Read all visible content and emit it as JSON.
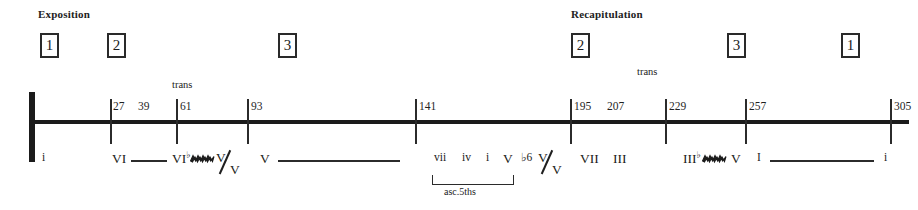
{
  "diagram": {
    "title_sections": [
      {
        "label": "Exposition",
        "x": 38,
        "y": 8
      },
      {
        "label": "Recapitulation",
        "x": 571,
        "y": 8
      }
    ],
    "theme_boxes": [
      {
        "number": "1",
        "x": 40,
        "y": 33
      },
      {
        "number": "2",
        "x": 107,
        "y": 33
      },
      {
        "number": "3",
        "x": 278,
        "y": 33
      },
      {
        "number": "2",
        "x": 571,
        "y": 33
      },
      {
        "number": "3",
        "x": 727,
        "y": 33
      },
      {
        "number": "1",
        "x": 841,
        "y": 33
      }
    ],
    "trans_labels": [
      {
        "label": "trans",
        "x": 172,
        "y": 79
      },
      {
        "label": "trans",
        "x": 637,
        "y": 66
      }
    ],
    "ticks": [
      {
        "x": 110
      },
      {
        "x": 176
      },
      {
        "x": 247
      },
      {
        "x": 415
      },
      {
        "x": 570
      },
      {
        "x": 665
      },
      {
        "x": 745
      },
      {
        "x": 890
      }
    ],
    "measure_numbers": [
      {
        "value": "27",
        "x": 113
      },
      {
        "value": "39",
        "x": 138
      },
      {
        "value": "61",
        "x": 180
      },
      {
        "value": "93",
        "x": 251
      },
      {
        "value": "141",
        "x": 419
      },
      {
        "value": "195",
        "x": 574
      },
      {
        "value": "207",
        "x": 607
      },
      {
        "value": "229",
        "x": 669
      },
      {
        "value": "257",
        "x": 749
      },
      {
        "value": "305",
        "x": 894
      }
    ],
    "harmonies": [
      {
        "text": "i",
        "x": 42,
        "size": "small"
      },
      {
        "text": "VI",
        "x": 112,
        "size": "normal"
      },
      {
        "text": "VI",
        "x": 172,
        "size": "normal",
        "sup": "♭"
      },
      {
        "text": "V",
        "x": 260,
        "size": "normal"
      },
      {
        "text": "vii",
        "x": 434,
        "size": "small"
      },
      {
        "text": "iv",
        "x": 462,
        "size": "small"
      },
      {
        "text": "i",
        "x": 486,
        "size": "small"
      },
      {
        "text": "V",
        "x": 503,
        "size": "normal"
      },
      {
        "text": "♭6",
        "x": 521,
        "size": "small"
      },
      {
        "text": "VII",
        "x": 580,
        "size": "normal"
      },
      {
        "text": "III",
        "x": 613,
        "size": "normal"
      },
      {
        "text": "III",
        "x": 683,
        "size": "normal",
        "sup": "♭"
      },
      {
        "text": "V",
        "x": 731,
        "size": "normal"
      },
      {
        "text": "I",
        "x": 757,
        "size": "small"
      },
      {
        "text": "i",
        "x": 884,
        "size": "small"
      }
    ],
    "fractions": [
      {
        "numerator": "V",
        "denominator": "V",
        "x": 216
      },
      {
        "numerator": "V",
        "denominator": "V",
        "x": 538
      }
    ],
    "zigzags": [
      {
        "x": 190
      },
      {
        "x": 702
      }
    ],
    "prolongations": [
      {
        "x": 131,
        "width": 36
      },
      {
        "x": 278,
        "width": 122
      },
      {
        "x": 770,
        "width": 104
      }
    ],
    "bracket": {
      "x": 432,
      "y": 175,
      "width": 80,
      "height": 9,
      "label": "asc.5ths",
      "label_x": 444,
      "label_y": 186
    },
    "colors": {
      "ink": "#1a1a1a",
      "background": "#ffffff"
    }
  }
}
